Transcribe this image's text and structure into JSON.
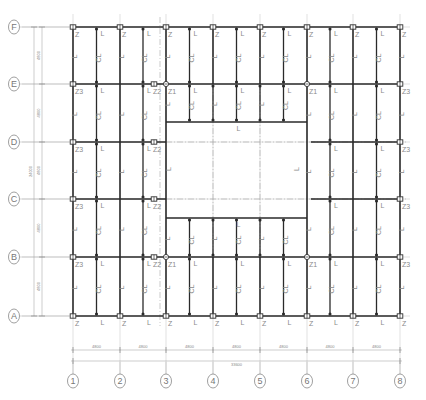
{
  "drawing": {
    "type": "structural-beam-layout-plan",
    "columns_axes": [
      "1",
      "2",
      "3",
      "4",
      "5",
      "6",
      "7",
      "8"
    ],
    "row_axes": [
      "A",
      "B",
      "C",
      "D",
      "E",
      "F"
    ],
    "column_x": [
      73,
      120,
      166,
      213,
      260,
      307,
      353,
      400
    ],
    "row_y": {
      "F": 27,
      "E": 84,
      "D": 142,
      "C": 199,
      "B": 257,
      "A": 316
    },
    "colors": {
      "beam": "#2a2a2a",
      "grid": "#b0b0b0",
      "centerline": "#a8a8a8",
      "text": "#8a8a8a",
      "axis_bubble": "#777777"
    }
  },
  "dimensions": {
    "horizontal_spans": [
      "4800",
      "4800",
      "4800",
      "4800",
      "4800",
      "4800",
      "4800"
    ],
    "horizontal_total": "33600",
    "vertical_spans": [
      "4800",
      "4800",
      "4800",
      "4800",
      "4800"
    ],
    "vertical_total": "24000"
  },
  "labels": {
    "column_Z": "Z",
    "column_Z1": "Z1",
    "column_Z2": "Z2",
    "column_Z3": "Z3",
    "beam_L": "L",
    "beam_CL": "CL"
  }
}
